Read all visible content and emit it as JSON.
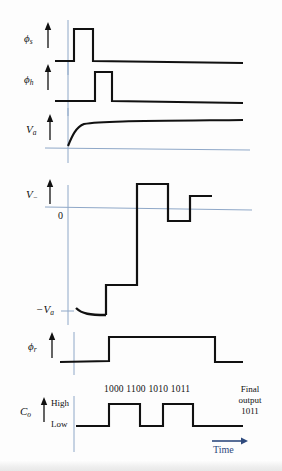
{
  "figure": {
    "type": "timing-diagram",
    "width": 282,
    "height": 471,
    "background_color": "#fdfdfd",
    "trace_color": "#111111",
    "axis_color": "#8fa8c8",
    "time_label_color": "#2e4a7d"
  },
  "traces": [
    {
      "id": "phi-s",
      "label_main": "ϕ",
      "label_sub": "s",
      "kind": "pulse",
      "baseline_y": 61,
      "high_y": 29,
      "axis_x": 68,
      "x_start": 55,
      "x_end": 243,
      "pulses": [
        {
          "from": 74,
          "to": 93
        }
      ]
    },
    {
      "id": "phi-h",
      "label_main": "ϕ",
      "label_sub": "h",
      "kind": "pulse",
      "baseline_y": 101,
      "high_y": 72,
      "axis_x": 68,
      "x_start": 55,
      "x_end": 243,
      "pulses": [
        {
          "from": 95,
          "to": 112
        }
      ]
    },
    {
      "id": "v-a",
      "label_main": "V",
      "label_sub": "a",
      "kind": "exponential-rise",
      "baseline_y": 146,
      "high_y": 122,
      "axis_x": 68,
      "x_start": 45,
      "x_end": 243
    },
    {
      "id": "v-minus",
      "label_main": "V",
      "label_sub": "−",
      "kind": "staircase",
      "zero_y": 208,
      "neg_va_y": 311,
      "axis_x": 68,
      "x_start": 45,
      "x_end": 250,
      "zero_tick_label": "0",
      "neg_label_main": "−V",
      "neg_label_sub": "a",
      "steps": [
        {
          "from": 74,
          "to": 106,
          "level": 311,
          "shape": "exp-dip"
        },
        {
          "from": 106,
          "to": 137,
          "level": 285
        },
        {
          "from": 137,
          "to": 168,
          "level": 184
        },
        {
          "from": 168,
          "to": 190,
          "level": 221
        },
        {
          "from": 190,
          "to": 212,
          "level": 196
        }
      ]
    },
    {
      "id": "phi-r",
      "label_main": "ϕ",
      "label_sub": "r",
      "kind": "pulse",
      "baseline_y": 361,
      "high_y": 337,
      "axis_x": 74,
      "x_start": 60,
      "x_end": 243,
      "pulses": [
        {
          "from": 109,
          "to": 215
        }
      ]
    },
    {
      "id": "c-o",
      "label_main": "C",
      "label_sub": "o",
      "kind": "digital",
      "low_y": 426,
      "high_y": 404,
      "axis_x": 74,
      "x_start": 60,
      "x_end": 243,
      "level_high_label": "High",
      "level_low_label": "Low",
      "pulses": [
        {
          "from": 109,
          "to": 140
        },
        {
          "from": 163,
          "to": 193
        }
      ]
    }
  ],
  "annotations": {
    "bit_codes": [
      "1000",
      "1100",
      "1010",
      "1011"
    ],
    "bit_codes_line": "1000 1100 1010 1011",
    "final_output_line1": "Final",
    "final_output_line2": "output",
    "final_output_line3": "1011",
    "time_axis_label": "Time"
  }
}
